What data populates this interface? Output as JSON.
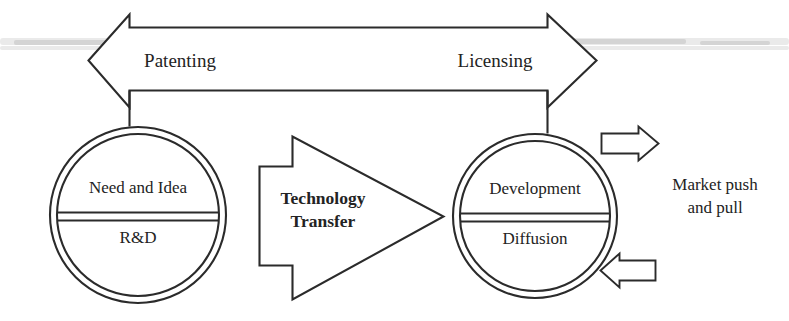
{
  "diagram": {
    "type": "process-flow",
    "title_text": null,
    "background_color": "#ffffff",
    "line_color": "#2b2b2b",
    "text_color": "#232323",
    "top_arrow": {
      "name": "double-headed-arrow",
      "direction": "bidirectional",
      "left_label": "Patenting",
      "right_label": "Licensing"
    },
    "left_node": {
      "name": "origin-circle",
      "shape": "double-circle",
      "top_label": "Need and Idea",
      "bottom_label": "R&D"
    },
    "center_arrow": {
      "name": "technology-transfer-arrow",
      "direction": "right",
      "line1": "Technology",
      "line2": "Transfer"
    },
    "right_node": {
      "name": "destination-circle",
      "shape": "double-circle",
      "top_label": "Development",
      "bottom_label": "Diffusion"
    },
    "market_arrows": {
      "name": "market-push-pull-arrows",
      "top_arrow_direction": "right",
      "bottom_arrow_direction": "left",
      "label_line1": "Market push",
      "label_line2": "and pull"
    }
  }
}
